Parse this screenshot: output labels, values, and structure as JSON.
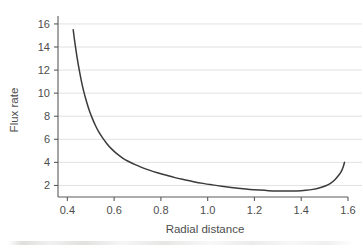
{
  "figure": {
    "background_color": "#ffffff",
    "axis_color": "#5a5a5a",
    "grid_color": "#d9d9d9",
    "curve_color": "#3a3a3a",
    "text_color": "#4d4d4d"
  },
  "chart_data": {
    "type": "line",
    "title": "",
    "xlabel": "Radial distance",
    "ylabel": "Flux rate",
    "xlim": [
      0.36,
      1.6
    ],
    "ylim": [
      1.0,
      16.6
    ],
    "xticks": [
      0.4,
      0.6,
      0.8,
      1.0,
      1.2,
      1.4,
      1.6
    ],
    "xtick_labels": [
      "0.4",
      "0.6",
      "0.8",
      "1.0",
      "1.2",
      "1.4",
      "1.6"
    ],
    "yticks": [
      2,
      4,
      6,
      8,
      10,
      12,
      14,
      16
    ],
    "ytick_labels": [
      "2",
      "4",
      "6",
      "8",
      "10",
      "12",
      "14",
      "16"
    ],
    "grid": "horizontal",
    "legend": "none",
    "series": [
      {
        "name": "flux rate",
        "x": [
          0.425,
          0.432,
          0.44,
          0.45,
          0.46,
          0.47,
          0.48,
          0.492,
          0.505,
          0.52,
          0.535,
          0.55,
          0.57,
          0.59,
          0.61,
          0.635,
          0.66,
          0.69,
          0.72,
          0.75,
          0.785,
          0.82,
          0.86,
          0.9,
          0.94,
          0.98,
          1.02,
          1.06,
          1.1,
          1.14,
          1.18,
          1.22,
          1.26,
          1.3,
          1.34,
          1.38,
          1.42,
          1.45,
          1.48,
          1.505,
          1.525,
          1.545,
          1.56,
          1.572,
          1.58,
          1.585
        ],
        "y": [
          15.5,
          14.4,
          13.3,
          12.1,
          11.05,
          10.15,
          9.4,
          8.6,
          7.9,
          7.2,
          6.62,
          6.15,
          5.6,
          5.15,
          4.78,
          4.4,
          4.1,
          3.8,
          3.55,
          3.33,
          3.1,
          2.9,
          2.68,
          2.5,
          2.33,
          2.18,
          2.05,
          1.93,
          1.83,
          1.74,
          1.66,
          1.6,
          1.55,
          1.52,
          1.51,
          1.52,
          1.58,
          1.66,
          1.8,
          1.97,
          2.18,
          2.52,
          2.88,
          3.25,
          3.65,
          4.0
        ]
      }
    ]
  }
}
